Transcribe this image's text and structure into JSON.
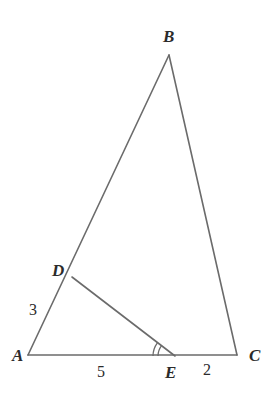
{
  "figure": {
    "kind": "euclidean-triangle-diagram",
    "width": 273,
    "height": 399,
    "background_color": "#ffffff",
    "stroke_color": "#6b6b6b",
    "text_color": "#2b2b2b",
    "stroke_width": 1.6
  },
  "points": {
    "A": {
      "label": "A",
      "x": 28,
      "y": 355,
      "label_x": 12,
      "label_y": 347
    },
    "B": {
      "label": "B",
      "x": 169,
      "y": 55,
      "label_x": 163,
      "label_y": 28
    },
    "C": {
      "label": "C",
      "x": 237,
      "y": 355,
      "label_x": 249,
      "label_y": 347
    },
    "D": {
      "label": "D",
      "x": 72,
      "y": 277,
      "label_x": 52,
      "label_y": 262
    },
    "E": {
      "label": "E",
      "x": 175,
      "y": 356,
      "label_x": 165,
      "label_y": 364
    }
  },
  "segments": [
    {
      "name": "AB",
      "from": "A",
      "to": "B"
    },
    {
      "name": "BC",
      "from": "B",
      "to": "C"
    },
    {
      "name": "AC",
      "from": "A",
      "to": "C"
    },
    {
      "name": "DE",
      "from": "D",
      "to": "E"
    }
  ],
  "length_labels": [
    {
      "name": "AD",
      "text": "3",
      "x": 29,
      "y": 302,
      "segment": "AD"
    },
    {
      "name": "AE",
      "text": "5",
      "x": 97,
      "y": 364,
      "segment": "AE"
    },
    {
      "name": "EC",
      "text": "2",
      "x": 203,
      "y": 362,
      "segment": "EC"
    }
  ],
  "angle_marks": [
    {
      "name": "angle-DEA",
      "vertex": "E",
      "arc_count": 2,
      "radii": [
        17,
        22
      ],
      "start_deg": 180,
      "end_deg": 217
    }
  ],
  "icons": {
    "angle-arc": "angle-arc-double-icon"
  }
}
